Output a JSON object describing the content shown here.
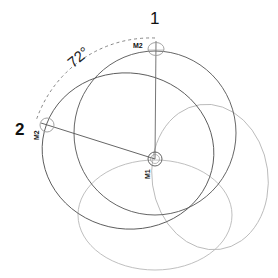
{
  "diagram": {
    "labels": {
      "position_1": "1",
      "position_2": "2",
      "angle": "72°",
      "m2_top": "M2",
      "m2_left": "M2",
      "m1": "M1"
    },
    "colors": {
      "dark_stroke": "#4a4a4a",
      "light_stroke": "#b5b5b5",
      "dashed": "#777777",
      "text": "#111111"
    },
    "geometry": {
      "m1_center": [
        155,
        159
      ],
      "m2_top_center": [
        156,
        49
      ],
      "m2_left_center": [
        47,
        125
      ],
      "rotation_angle_deg": 72
    }
  }
}
